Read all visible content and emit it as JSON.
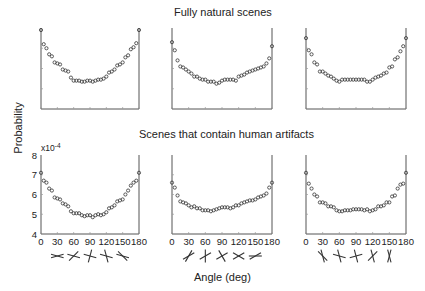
{
  "titles": {
    "top_row": "Fully natural scenes",
    "bottom_row": "Scenes that contain human artifacts",
    "y_axis": "Probability",
    "x_axis": "Angle (deg)",
    "y_exponent": "x10",
    "y_exponent_power": "-4"
  },
  "chart_data": [
    {
      "type": "scatter",
      "title": "Fully natural scenes — panel 1",
      "xlabel": "",
      "ylabel": "Probability",
      "x": [
        0,
        5,
        10,
        15,
        20,
        25,
        30,
        35,
        40,
        45,
        50,
        55,
        60,
        65,
        70,
        75,
        80,
        85,
        90,
        95,
        100,
        105,
        110,
        115,
        120,
        125,
        130,
        135,
        140,
        145,
        150,
        155,
        160,
        165,
        170,
        175,
        180
      ],
      "values": [
        7.9,
        7.2,
        7.0,
        6.7,
        6.6,
        6.3,
        6.25,
        6.2,
        5.95,
        5.9,
        5.85,
        5.55,
        5.4,
        5.4,
        5.4,
        5.35,
        5.35,
        5.4,
        5.4,
        5.35,
        5.4,
        5.45,
        5.45,
        5.5,
        5.6,
        5.8,
        5.85,
        5.95,
        6.15,
        6.2,
        6.3,
        6.55,
        6.65,
        6.95,
        7.05,
        7.25,
        7.9
      ],
      "ylim": [
        4,
        8
      ],
      "xlim": [
        0,
        180
      ],
      "grid": false
    },
    {
      "type": "scatter",
      "title": "Fully natural scenes — panel 2",
      "x": [
        0,
        5,
        10,
        15,
        20,
        25,
        30,
        35,
        40,
        45,
        50,
        55,
        60,
        65,
        70,
        75,
        80,
        85,
        90,
        95,
        100,
        105,
        110,
        115,
        120,
        125,
        130,
        135,
        140,
        145,
        150,
        155,
        160,
        165,
        170,
        175,
        180
      ],
      "values": [
        7.3,
        6.9,
        6.4,
        6.1,
        6.05,
        5.95,
        5.85,
        5.75,
        5.6,
        5.6,
        5.5,
        5.45,
        5.45,
        5.35,
        5.35,
        5.35,
        5.25,
        5.3,
        5.4,
        5.45,
        5.45,
        5.45,
        5.45,
        5.4,
        5.6,
        5.65,
        5.7,
        5.8,
        5.85,
        5.9,
        5.95,
        6.0,
        6.05,
        6.1,
        6.25,
        6.5,
        7.1
      ],
      "ylim": [
        4,
        8
      ],
      "xlim": [
        0,
        180
      ],
      "grid": false
    },
    {
      "type": "scatter",
      "title": "Fully natural scenes — panel 3",
      "x": [
        0,
        5,
        10,
        15,
        20,
        25,
        30,
        35,
        40,
        45,
        50,
        55,
        60,
        65,
        70,
        75,
        80,
        85,
        90,
        95,
        100,
        105,
        110,
        115,
        120,
        125,
        130,
        135,
        140,
        145,
        150,
        155,
        160,
        165,
        170,
        175,
        180
      ],
      "values": [
        7.5,
        6.9,
        6.7,
        6.3,
        6.2,
        5.85,
        5.85,
        5.75,
        5.65,
        5.6,
        5.5,
        5.4,
        5.35,
        5.45,
        5.45,
        5.45,
        5.45,
        5.45,
        5.45,
        5.45,
        5.45,
        5.45,
        5.35,
        5.35,
        5.45,
        5.55,
        5.6,
        5.65,
        5.75,
        5.8,
        6.05,
        6.1,
        6.45,
        6.55,
        6.85,
        7.1,
        7.5
      ],
      "ylim": [
        4,
        8
      ],
      "xlim": [
        0,
        180
      ],
      "grid": false
    },
    {
      "type": "scatter",
      "title": "Scenes that contain human artifacts — panel 1",
      "xlabel": "Angle (deg)",
      "ylabel": "Probability (x10^-4)",
      "x": [
        0,
        5,
        10,
        15,
        20,
        25,
        30,
        35,
        40,
        45,
        50,
        55,
        60,
        65,
        70,
        75,
        80,
        85,
        90,
        95,
        100,
        105,
        110,
        115,
        120,
        125,
        130,
        135,
        140,
        145,
        150,
        155,
        160,
        165,
        170,
        175,
        180
      ],
      "values": [
        7.1,
        6.7,
        6.6,
        6.3,
        6.2,
        5.85,
        5.8,
        5.75,
        5.55,
        5.5,
        5.4,
        5.15,
        5.05,
        5.05,
        5.05,
        4.95,
        4.9,
        4.95,
        4.95,
        4.85,
        4.95,
        5.0,
        4.95,
        5.0,
        5.1,
        5.3,
        5.35,
        5.45,
        5.65,
        5.7,
        5.75,
        6.0,
        6.2,
        6.45,
        6.6,
        6.7,
        7.1
      ],
      "xticks": [
        0,
        30,
        60,
        90,
        120,
        150,
        180
      ],
      "yticks": [
        4,
        5,
        6,
        7,
        8
      ],
      "ylim": [
        4,
        8
      ],
      "xlim": [
        0,
        180
      ],
      "grid": false
    },
    {
      "type": "scatter",
      "title": "Scenes that contain human artifacts — panel 2",
      "xlabel": "Angle (deg)",
      "x": [
        0,
        5,
        10,
        15,
        20,
        25,
        30,
        35,
        40,
        45,
        50,
        55,
        60,
        65,
        70,
        75,
        80,
        85,
        90,
        95,
        100,
        105,
        110,
        115,
        120,
        125,
        130,
        135,
        140,
        145,
        150,
        155,
        160,
        165,
        170,
        175,
        180
      ],
      "values": [
        6.6,
        6.35,
        5.95,
        5.65,
        5.6,
        5.55,
        5.45,
        5.35,
        5.4,
        5.3,
        5.3,
        5.2,
        5.2,
        5.2,
        5.15,
        5.2,
        5.25,
        5.3,
        5.35,
        5.35,
        5.35,
        5.3,
        5.35,
        5.45,
        5.45,
        5.55,
        5.6,
        5.65,
        5.7,
        5.7,
        5.75,
        5.85,
        5.9,
        5.95,
        6.05,
        6.35,
        6.6
      ],
      "xticks": [
        0,
        30,
        60,
        90,
        120,
        150,
        180
      ],
      "ylim": [
        4,
        8
      ],
      "xlim": [
        0,
        180
      ],
      "grid": false
    },
    {
      "type": "scatter",
      "title": "Scenes that contain human artifacts — panel 3",
      "xlabel": "Angle (deg)",
      "x": [
        0,
        5,
        10,
        15,
        20,
        25,
        30,
        35,
        40,
        45,
        50,
        55,
        60,
        65,
        70,
        75,
        80,
        85,
        90,
        95,
        100,
        105,
        110,
        115,
        120,
        125,
        130,
        135,
        140,
        145,
        150,
        155,
        160,
        165,
        170,
        175,
        180
      ],
      "values": [
        7.1,
        6.55,
        6.3,
        6.0,
        5.9,
        5.6,
        5.6,
        5.55,
        5.4,
        5.4,
        5.35,
        5.2,
        5.15,
        5.15,
        5.2,
        5.2,
        5.2,
        5.25,
        5.25,
        5.25,
        5.25,
        5.2,
        5.25,
        5.15,
        5.2,
        5.25,
        5.4,
        5.4,
        5.45,
        5.6,
        5.6,
        5.9,
        5.95,
        6.3,
        6.5,
        6.55,
        7.1
      ],
      "xticks": [
        0,
        30,
        60,
        90,
        120,
        150,
        180
      ],
      "ylim": [
        4,
        8
      ],
      "xlim": [
        0,
        180
      ],
      "grid": false
    }
  ],
  "tick_labels": {
    "x": [
      "0",
      "30",
      "60",
      "90",
      "120",
      "150",
      "180"
    ],
    "y": [
      "4",
      "5",
      "6",
      "7",
      "8"
    ]
  },
  "glyph_rows": [
    {
      "panel": 1,
      "description": "pairs of crossing line segments illustrating angles 30, 60, 90, 120, 150 deg (horizontal reference)"
    },
    {
      "panel": 2,
      "description": "pairs of crossing line segments illustrating angles 30, 60, 90, 120, 150 deg (diagonal reference)"
    },
    {
      "panel": 3,
      "description": "pairs of crossing line segments illustrating angles 30, 60, 90, 120, 150 deg (vertical reference)"
    }
  ]
}
